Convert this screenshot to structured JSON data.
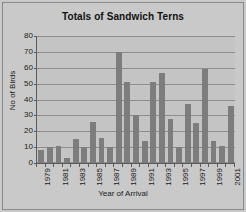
{
  "chart_data": {
    "type": "bar",
    "title": "Totals of Sandwich Terns",
    "xlabel": "Year of Arrival",
    "ylabel": "No of Birds",
    "categories": [
      "1979",
      "1980",
      "1981",
      "1982",
      "1983",
      "1984",
      "1985",
      "1986",
      "1987",
      "1988",
      "1989",
      "1990",
      "1991",
      "1992",
      "1993",
      "1994",
      "1995",
      "1996",
      "1997",
      "1998",
      "1999",
      "2000",
      "2001"
    ],
    "values": [
      8,
      10,
      11,
      3,
      15,
      10,
      26,
      16,
      10,
      70,
      51,
      30,
      14,
      51,
      57,
      28,
      10,
      37,
      25,
      59,
      14,
      11,
      36
    ],
    "tick_labels_shown": [
      "1979",
      "",
      "1981",
      "",
      "1983",
      "",
      "1985",
      "",
      "1987",
      "",
      "1989",
      "",
      "1991",
      "",
      "1993",
      "",
      "1995",
      "",
      "1997",
      "",
      "1999",
      "",
      "2001"
    ],
    "ylim": [
      0,
      80
    ],
    "yticks": [
      0,
      10,
      20,
      30,
      40,
      50,
      60,
      70,
      80
    ],
    "grid": true,
    "legend": false,
    "bar_color": "#7d7d7d",
    "plot_background": "#c4c4c4",
    "figure_background": "#c9c9c9",
    "axis_color": "#5a5a5a",
    "grid_color": "#8e8e8e"
  }
}
